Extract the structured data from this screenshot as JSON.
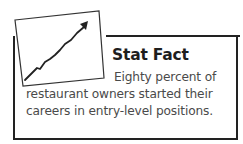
{
  "sidebar_box": {
    "icon": "rising-line-chart-icon",
    "title": "Stat Fact",
    "body_lines": [
      "Eighty percent of",
      "restaurant owners started their",
      "careers in entry-level positions."
    ]
  }
}
